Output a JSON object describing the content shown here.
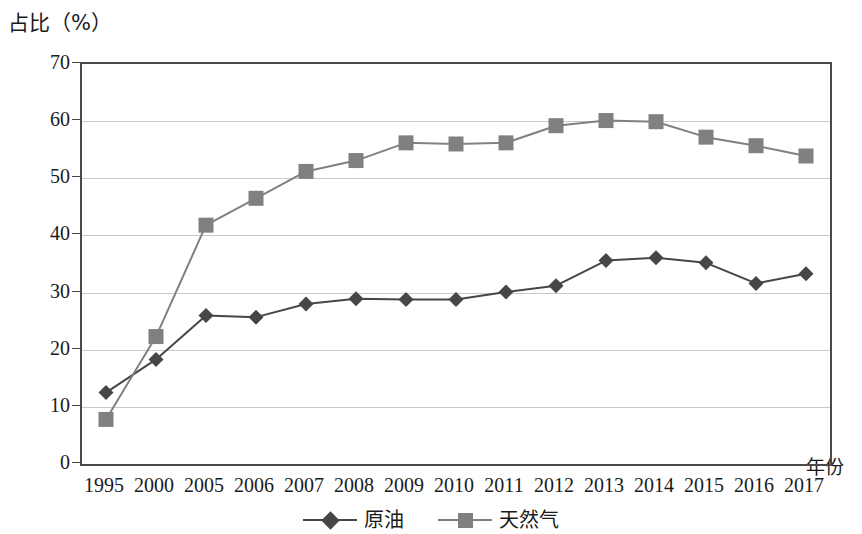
{
  "chart_data": {
    "type": "line",
    "title": "",
    "xlabel": "年份",
    "ylabel": "占比（%）",
    "categories": [
      "1995",
      "2000",
      "2005",
      "2006",
      "2007",
      "2008",
      "2009",
      "2010",
      "2011",
      "2012",
      "2013",
      "2014",
      "2015",
      "2016",
      "2017"
    ],
    "series": [
      {
        "name": "原油",
        "color": "#464646",
        "marker": "diamond",
        "values": [
          12.5,
          18.3,
          26.0,
          25.7,
          28.0,
          28.9,
          28.8,
          28.8,
          30.1,
          31.2,
          35.6,
          36.1,
          35.2,
          31.6,
          33.3
        ]
      },
      {
        "name": "天然气",
        "color": "#808080",
        "marker": "square",
        "values": [
          7.8,
          22.3,
          41.8,
          46.5,
          51.2,
          53.1,
          56.2,
          56.0,
          56.2,
          59.2,
          60.1,
          59.9,
          57.2,
          55.7,
          53.9
        ]
      }
    ],
    "ylim": [
      0,
      70
    ],
    "yticks": [
      0,
      10,
      20,
      30,
      40,
      50,
      60,
      70
    ],
    "ytick_labels": [
      "0",
      "10",
      "20",
      "30",
      "40",
      "50",
      "60",
      "70"
    ],
    "grid": true,
    "grid_color": "#c9c9c9",
    "legend_position": "bottom",
    "axis_color": "#4a4a4a"
  }
}
